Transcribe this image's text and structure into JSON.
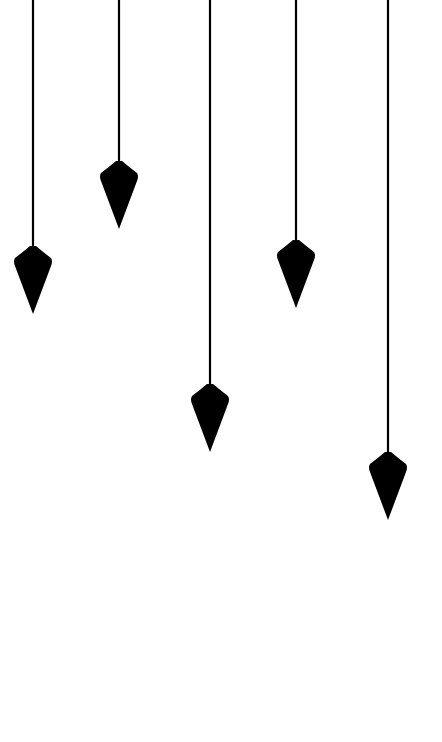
{
  "scene": {
    "background": "#ffffff",
    "color": "#000000",
    "pendulums": [
      {
        "x": 33,
        "bob_top": 246
      },
      {
        "x": 119,
        "bob_top": 161
      },
      {
        "x": 210,
        "bob_top": 384
      },
      {
        "x": 296,
        "bob_top": 240
      },
      {
        "x": 388,
        "bob_top": 452
      }
    ]
  }
}
